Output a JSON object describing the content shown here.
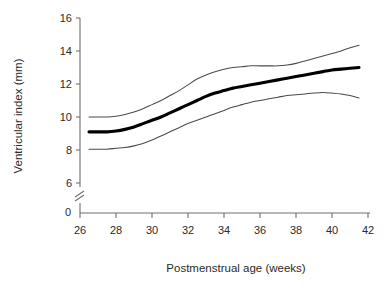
{
  "chart_data": {
    "type": "line",
    "title": "",
    "xlabel": "Postmenstrual age (weeks)",
    "ylabel": "Ventricular index (mm)",
    "xlim": [
      26,
      42
    ],
    "ylim": [
      6,
      16
    ],
    "y_axis_break": true,
    "y_axis_break_label": "0",
    "xticks": [
      26,
      28,
      30,
      32,
      34,
      36,
      38,
      40,
      42
    ],
    "yticks": [
      6,
      8,
      10,
      12,
      14,
      16
    ],
    "xtick_labels": [
      "26",
      "28",
      "30",
      "32",
      "34",
      "36",
      "38",
      "40",
      "42"
    ],
    "ytick_labels": [
      "6",
      "8",
      "10",
      "12",
      "14",
      "16"
    ],
    "grid": false,
    "legend": "none",
    "x": [
      26.5,
      27.0,
      27.5,
      28.0,
      28.5,
      29.0,
      29.5,
      30.0,
      30.5,
      31.0,
      31.5,
      32.0,
      32.5,
      33.0,
      33.5,
      34.0,
      34.5,
      35.0,
      35.5,
      36.0,
      36.5,
      37.0,
      37.5,
      38.0,
      38.5,
      39.0,
      39.5,
      40.0,
      40.5,
      41.0,
      41.5
    ],
    "series": [
      {
        "name": "upper limit",
        "style": "thin-line",
        "color": "#4a4a4a",
        "values": [
          10.0,
          10.0,
          10.0,
          10.05,
          10.15,
          10.3,
          10.5,
          10.75,
          11.0,
          11.3,
          11.6,
          11.95,
          12.3,
          12.55,
          12.75,
          12.9,
          13.0,
          13.05,
          13.1,
          13.1,
          13.1,
          13.1,
          13.15,
          13.25,
          13.4,
          13.55,
          13.7,
          13.85,
          14.0,
          14.2,
          14.35
        ]
      },
      {
        "name": "mean",
        "style": "thick-line",
        "color": "#000000",
        "values": [
          9.1,
          9.1,
          9.1,
          9.15,
          9.25,
          9.4,
          9.6,
          9.8,
          10.0,
          10.25,
          10.5,
          10.75,
          11.0,
          11.25,
          11.45,
          11.6,
          11.75,
          11.85,
          11.95,
          12.05,
          12.15,
          12.25,
          12.35,
          12.45,
          12.55,
          12.65,
          12.75,
          12.85,
          12.9,
          12.95,
          13.0
        ]
      },
      {
        "name": "lower limit",
        "style": "thin-line",
        "color": "#4a4a4a",
        "values": [
          8.05,
          8.05,
          8.05,
          8.1,
          8.15,
          8.25,
          8.4,
          8.6,
          8.85,
          9.1,
          9.35,
          9.6,
          9.8,
          10.0,
          10.2,
          10.4,
          10.6,
          10.75,
          10.9,
          11.0,
          11.1,
          11.2,
          11.3,
          11.35,
          11.4,
          11.45,
          11.48,
          11.45,
          11.4,
          11.3,
          11.15
        ]
      }
    ]
  }
}
